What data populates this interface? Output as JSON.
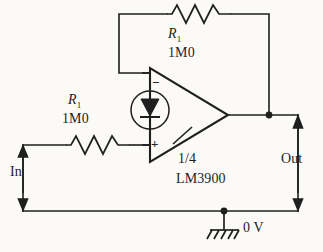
{
  "diagram": {
    "background_color": "#fbfaf7",
    "line_color": "#1f1f1f",
    "components": {
      "feedback_resistor": {
        "name": "feedback-resistor",
        "designator": "R",
        "designator_subscript": "1",
        "value": "1M0"
      },
      "input_resistor": {
        "name": "input-resistor",
        "designator": "R",
        "designator_subscript": "1",
        "value": "1M0"
      },
      "amplifier": {
        "name": "norton-amplifier",
        "fraction_label": "1/4",
        "part_number": "LM3900",
        "inverting_terminal": "−",
        "noninverting_terminal": "+",
        "current_mirror_icon": "diode-in-circle-icon"
      },
      "ground": {
        "name": "ground-symbol",
        "label": "0 V",
        "icon": "earth-ground-hatched-icon"
      }
    },
    "ports": {
      "input": {
        "name": "input-port",
        "label": "In",
        "arrow_icon": "double-headed-vertical-arrow-icon"
      },
      "output": {
        "name": "output-port",
        "label": "Out",
        "arrow_icon": "double-headed-vertical-arrow-icon"
      }
    },
    "nodes": {
      "output_junction": "junction-dot",
      "ground_junction": "junction-dot"
    }
  }
}
